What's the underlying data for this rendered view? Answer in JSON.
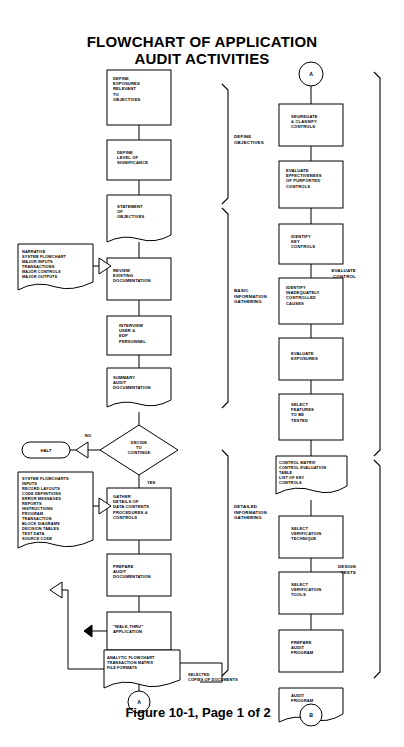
{
  "title": {
    "line1": "FLOWCHART OF APPLICATION",
    "line2": "AUDIT ACTIVITIES"
  },
  "footer": {
    "caption": "Figure 10-1, Page 1 of 2"
  },
  "connectors": {
    "top_right": "A",
    "bottom_left": "A",
    "bottom_right": "B"
  },
  "edge_labels": {
    "no": "NO",
    "yes": "YES"
  },
  "brackets": [
    {
      "id": "define-objectives",
      "label": "DEFINE\nOBJECTIVES"
    },
    {
      "id": "basic-information-gathering",
      "label": "BASIC\nINFORMATION\nGATHERING"
    },
    {
      "id": "detailed-information-gathering",
      "label": "DETAILED\nINFORMATION\nGATHERING"
    },
    {
      "id": "evaluate-control",
      "label": "EVALUATE\nCONTROL"
    },
    {
      "id": "design-tests",
      "label": "DESIGN\nTESTS"
    }
  ],
  "left_column": [
    {
      "id": "define-exposures",
      "shape": "process",
      "label": "DEFINE\nEXPOSURES\nRELEVANT\nTO\nOBJECTIVES"
    },
    {
      "id": "define-level-of-significance",
      "shape": "process",
      "label": "DEFINE\nLEVEL OF\nSIGNIFICANCE"
    },
    {
      "id": "statement-of-objectives",
      "shape": "document",
      "label": "STATEMENT\nOF\nOBJECTIVES"
    },
    {
      "id": "review-existing-documentation",
      "shape": "process",
      "label": "REVIEW\nEXISTING\nDOCUMENTATION"
    },
    {
      "id": "interview-user-edp-personnel",
      "shape": "process",
      "label": "INTERVIEW\nUSER &\nEDP\nPERSONNEL"
    },
    {
      "id": "summary-audit-documentation",
      "shape": "document",
      "label": "SUMMARY\nAUDIT\nDOCUMENTATION"
    },
    {
      "id": "decide-to-continue",
      "shape": "decision",
      "label": "DECIDE\nTO\nCONTINUE"
    },
    {
      "id": "gather-details",
      "shape": "process",
      "label": "GATHER\nDETAILS OF\nDATA CONTENTS\nPROCEDURES &\nCONTROLS"
    },
    {
      "id": "prepare-audit-documentation",
      "shape": "process",
      "label": "PREPARE\nAUDIT\nDOCUMENTATION"
    },
    {
      "id": "walk-thru-application",
      "shape": "process",
      "label": "\"WALK-THRU\"\nAPPLICATION"
    },
    {
      "id": "analytic-flowchart",
      "shape": "document",
      "label": "ANALYTIC FLOWCHART\nTRANSACTION MATRIX\nFILE FORMATS"
    }
  ],
  "left_inputs": [
    {
      "id": "narrative-inputs",
      "shape": "document",
      "label": "NARRATIVE\nSYSTEM  FLOWCHART\nMAJOR INPUTS\nTRANSACTIONS\nMAJOR CONTROLS\nMAJOR OUTPUTS"
    },
    {
      "id": "system-flowcharts-inputs",
      "shape": "document",
      "label": "SYSTEM  FLOWCHARTS\nINPUTS\nRECORD  LAYOUTS\nCODE  DEFINITIONS\nERROR MESSAGES\nREPORTS\nINSTRUCTIONS\nPROGRAM\nTRANSACTION\nBLOCK  DIAGRAMS\nDECISION TABLES\nTEST  DATA\nSOURCE  CODE"
    }
  ],
  "terminators": [
    {
      "id": "halt",
      "shape": "terminator",
      "label": "HALT"
    }
  ],
  "annotations": [
    {
      "id": "selected-copies-of-documents",
      "label": "SELECTED\nCOPIES OF DOCUMENTS"
    }
  ],
  "right_column": [
    {
      "id": "segregate-classify-controls",
      "shape": "process",
      "label": "SEGREGATE\n&  CLASSIFY\nCONTROLS"
    },
    {
      "id": "evaluate-effectiveness",
      "shape": "process",
      "label": "EVALUATE\nEFFECTIVENESS\nOF  PURPORTED\nCONTROLS"
    },
    {
      "id": "identify-key-controls",
      "shape": "process",
      "label": "IDENTIFY\nKEY\nCONTROLS"
    },
    {
      "id": "identify-inadequately-controlled-causes",
      "shape": "process",
      "label": "IDENTIFY\nINADEQUATELY\nCONTROLLED\nCAUSES"
    },
    {
      "id": "evaluate-exposures",
      "shape": "process",
      "label": "EVALUATE\nEXPOSURES"
    },
    {
      "id": "select-features-to-be-tested",
      "shape": "process",
      "label": "SELECT\nFEATURES\nTO  BE\nTESTED"
    },
    {
      "id": "control-matrix",
      "shape": "document",
      "label": "CONTROL  MATRIX\nCONTROL  EVALUATION\nTABLE\nLIST  OF  KEY\nCONTROLS"
    },
    {
      "id": "select-verification-technique",
      "shape": "process",
      "label": "SELECT\nVERIFICATION\nTECHNIQUE"
    },
    {
      "id": "select-verification-tools",
      "shape": "process",
      "label": "SELECT\nVERIFICATION\nTOOLS"
    },
    {
      "id": "prepare-audit-program",
      "shape": "process",
      "label": "PREPARE\nAUDIT\nPROGRAM"
    },
    {
      "id": "audit-program",
      "shape": "document",
      "label": "AUDIT\nPROGRAM"
    }
  ]
}
